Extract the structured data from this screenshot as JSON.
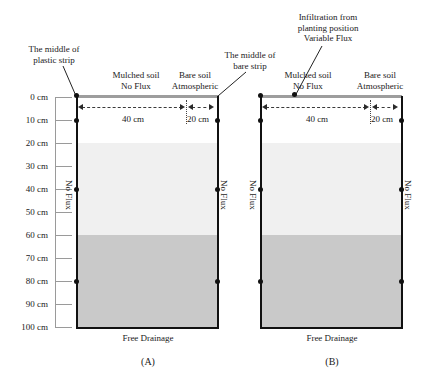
{
  "figure": {
    "title_annotations": {
      "middle_plastic_strip": "The middle of\nplastic strip",
      "middle_bare_strip": "The middle of\nbare strip",
      "infiltration": "Infiltration from\nplanting position\nVariable Flux"
    },
    "depth_axis": {
      "unit": "cm",
      "labels": [
        "0 cm",
        "10 cm",
        "20 cm",
        "30 cm",
        "40 cm",
        "50 cm",
        "60 cm",
        "70 cm",
        "80 cm",
        "90 cm",
        "100 cm"
      ],
      "values": [
        0,
        10,
        20,
        30,
        40,
        50,
        60,
        70,
        80,
        90,
        100
      ]
    },
    "panels": [
      {
        "caption": "(A)",
        "surface_left": {
          "line1": "Mulched soil",
          "line2": "No Flux"
        },
        "surface_right": {
          "line1": "Bare soil",
          "line2": "Atmospheric"
        },
        "width_left": "40 cm",
        "width_right": "20 cm",
        "left_boundary": "No Flux",
        "right_boundary": "No Flux",
        "bottom_boundary": "Free Drainage",
        "has_infiltration_arrow": false
      },
      {
        "caption": "(B)",
        "surface_left": {
          "line1": "Mulched soil",
          "line2": "No Flux"
        },
        "surface_right": {
          "line1": "Bare soil",
          "line2": "Atmospheric"
        },
        "width_left": "40 cm",
        "width_right": "20 cm",
        "left_boundary": "No Flux",
        "right_boundary": "No Flux",
        "bottom_boundary": "Free Drainage",
        "has_infiltration_arrow": true
      }
    ],
    "soil_layers": [
      {
        "top_cm": 0,
        "bottom_cm": 20,
        "color": "#ffffff"
      },
      {
        "top_cm": 20,
        "bottom_cm": 60,
        "color": "#f0f0f0"
      },
      {
        "top_cm": 60,
        "bottom_cm": 100,
        "color": "#c9c9c9"
      }
    ],
    "observation_nodes_cm": [
      10,
      40,
      80
    ],
    "colors": {
      "mulch_bar": "#9d9d9d",
      "outline": "#111111",
      "text": "#1a1a1a",
      "ruler": "#9a9a9a"
    }
  }
}
